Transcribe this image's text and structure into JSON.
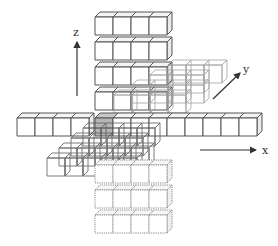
{
  "diagram": {
    "type": "3d-cube-cross",
    "axes": {
      "x": {
        "label": "x",
        "start": [
          200,
          150
        ],
        "end": [
          256,
          150
        ],
        "label_pos": [
          262,
          154
        ]
      },
      "y": {
        "label": "y",
        "start": [
          213,
          99
        ],
        "end": [
          240,
          73
        ],
        "label_pos": [
          243,
          73
        ]
      },
      "z": {
        "label": "z",
        "start": [
          77,
          96
        ],
        "end": [
          77,
          42
        ],
        "label_pos": [
          73,
          36
        ]
      }
    },
    "projection": {
      "cube_size": 18,
      "depth_dx": 5,
      "depth_dy": -5
    },
    "colors": {
      "solid_stroke": "#555555",
      "light_stroke": "#9a9a9a",
      "dotted_stroke": "#888888",
      "center_fill": "#b5b5b5",
      "face_fill": "#ffffff"
    },
    "groups": [
      {
        "name": "z-upper-column",
        "style": "solid",
        "cubes": [
          [
            95,
            17
          ],
          [
            113,
            17
          ],
          [
            131,
            17
          ],
          [
            149,
            17
          ],
          [
            95,
            42
          ],
          [
            113,
            42
          ],
          [
            131,
            42
          ],
          [
            149,
            42
          ],
          [
            95,
            67
          ],
          [
            113,
            67
          ],
          [
            131,
            67
          ],
          [
            149,
            67
          ],
          [
            95,
            92
          ],
          [
            113,
            92
          ],
          [
            131,
            92
          ],
          [
            149,
            92
          ]
        ]
      },
      {
        "name": "y-back-arm",
        "style": "light",
        "cubes": [
          [
            168,
            65
          ],
          [
            186,
            65
          ],
          [
            204,
            65
          ],
          [
            150,
            75
          ],
          [
            168,
            75
          ],
          [
            186,
            75
          ],
          [
            132,
            85
          ],
          [
            150,
            85
          ],
          [
            168,
            85
          ],
          [
            186,
            85
          ],
          [
            114,
            95
          ],
          [
            132,
            95
          ],
          [
            150,
            95
          ],
          [
            168,
            95
          ]
        ]
      },
      {
        "name": "x-left-arm",
        "style": "solid",
        "cubes": [
          [
            17,
            118
          ],
          [
            35,
            118
          ],
          [
            53,
            118
          ],
          [
            71,
            118
          ]
        ]
      },
      {
        "name": "center-cube",
        "style": "center",
        "cubes": [
          [
            95,
            118
          ]
        ]
      },
      {
        "name": "x-right-arm",
        "style": "solid",
        "cubes": [
          [
            113,
            118
          ],
          [
            131,
            118
          ],
          [
            149,
            118
          ],
          [
            167,
            118
          ],
          [
            185,
            118
          ],
          [
            203,
            118
          ],
          [
            221,
            118
          ],
          [
            239,
            118
          ]
        ]
      },
      {
        "name": "y-front-arm",
        "style": "dark",
        "cubes": [
          [
            83,
            128
          ],
          [
            101,
            128
          ],
          [
            119,
            128
          ],
          [
            137,
            128
          ],
          [
            71,
            138
          ],
          [
            89,
            138
          ],
          [
            107,
            138
          ],
          [
            125,
            138
          ],
          [
            59,
            148
          ],
          [
            77,
            148
          ],
          [
            95,
            148
          ],
          [
            113,
            148
          ],
          [
            131,
            148
          ],
          [
            47,
            158
          ],
          [
            65,
            158
          ],
          [
            83,
            158
          ],
          [
            101,
            158
          ],
          [
            119,
            158
          ]
        ]
      },
      {
        "name": "z-lower-column",
        "style": "dotted",
        "cubes": [
          [
            95,
            165
          ],
          [
            113,
            165
          ],
          [
            131,
            165
          ],
          [
            149,
            165
          ],
          [
            95,
            190
          ],
          [
            113,
            190
          ],
          [
            131,
            190
          ],
          [
            149,
            190
          ],
          [
            95,
            215
          ],
          [
            113,
            215
          ],
          [
            131,
            215
          ],
          [
            149,
            215
          ]
        ]
      }
    ]
  }
}
